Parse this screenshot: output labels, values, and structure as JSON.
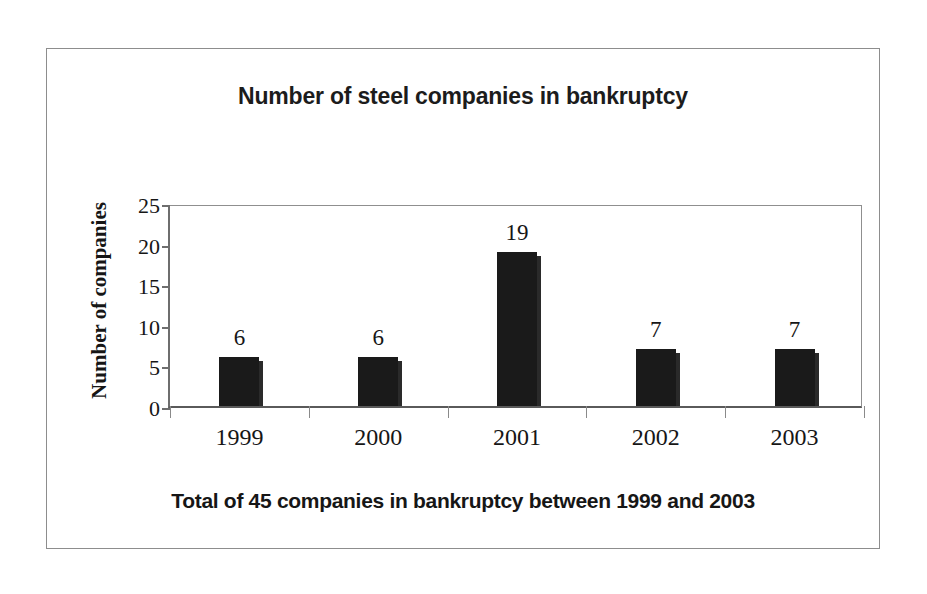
{
  "chart_data": {
    "type": "bar",
    "title": "Number of steel companies in bankruptcy",
    "caption": "Total of 45 companies in bankruptcy between 1999 and 2003",
    "xlabel": "",
    "ylabel": "Number of companies",
    "categories": [
      "1999",
      "2000",
      "2001",
      "2002",
      "2003"
    ],
    "values": [
      6,
      6,
      19,
      7,
      7
    ],
    "value_labels": [
      "6",
      "6",
      "19",
      "7",
      "7"
    ],
    "ylim": [
      0,
      25
    ],
    "ytick_labels": [
      "25",
      "20",
      "15",
      "10",
      "5",
      "0"
    ],
    "ytick_values": [
      25,
      20,
      15,
      10,
      5,
      0
    ],
    "grid": false,
    "legend": "none",
    "bar_color": "#1a1a1a",
    "axis_color": "#6e6e6e",
    "background_color": "#ffffff",
    "frame_color": "#8d8d8d"
  }
}
